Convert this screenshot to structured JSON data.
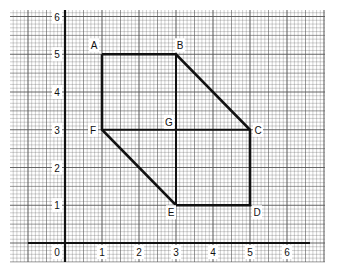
{
  "diagram": {
    "type": "coordinate-grid-polygon",
    "background": "#ffffff",
    "ink_color": "#111111",
    "grid_color": "#555555",
    "axes": {
      "x_ticks": [
        "0",
        "1",
        "2",
        "3",
        "4",
        "5",
        "6"
      ],
      "y_ticks": [
        "1",
        "2",
        "3",
        "4",
        "5",
        "6"
      ],
      "x_range": [
        -1.5,
        7
      ],
      "y_range": [
        -0.5,
        6.2
      ]
    },
    "points": [
      {
        "label": "A",
        "x": 1,
        "y": 5
      },
      {
        "label": "B",
        "x": 3,
        "y": 5
      },
      {
        "label": "C",
        "x": 5,
        "y": 3
      },
      {
        "label": "D",
        "x": 5,
        "y": 1
      },
      {
        "label": "E",
        "x": 3,
        "y": 1
      },
      {
        "label": "F",
        "x": 1,
        "y": 3
      },
      {
        "label": "G",
        "x": 3,
        "y": 3
      }
    ],
    "outline": [
      "A",
      "B",
      "C",
      "D",
      "E",
      "F",
      "A"
    ],
    "inner_segments": [
      [
        "B",
        "E"
      ],
      [
        "F",
        "C"
      ]
    ]
  }
}
